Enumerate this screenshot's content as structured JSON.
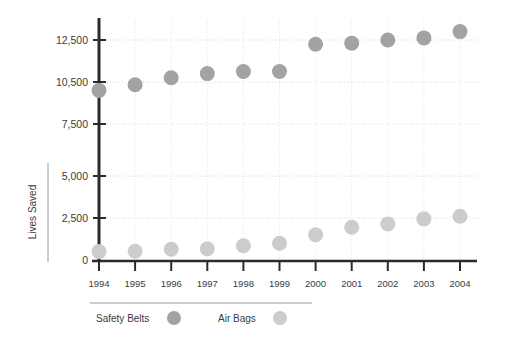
{
  "chart_data": {
    "type": "scatter",
    "title": "",
    "xlabel": "",
    "ylabel": "Lives Saved",
    "categories": [
      "1994",
      "1995",
      "1996",
      "1997",
      "1998",
      "1999",
      "2000",
      "2001",
      "2002",
      "2003",
      "2004"
    ],
    "ytick_labels": [
      "0",
      "2,500",
      "5,000",
      "7,500",
      "10,500",
      "12,500"
    ],
    "ytick_values": [
      0,
      2500,
      5000,
      7500,
      10500,
      12500
    ],
    "ylim": [
      0,
      13200
    ],
    "grid": true,
    "legend_position": "bottom",
    "series": [
      {
        "name": "Safety Belts",
        "color": "#a3a3a3",
        "values": [
          9900,
          10300,
          10700,
          10900,
          11000,
          11000,
          12300,
          12350,
          12500,
          12600,
          12900
        ]
      },
      {
        "name": "Air Bags",
        "color": "#cccccc",
        "values": [
          500,
          520,
          640,
          670,
          850,
          1000,
          1500,
          1950,
          2150,
          2450,
          2600
        ]
      }
    ]
  },
  "legend": {
    "items": [
      {
        "label": "Safety Belts",
        "color": "#a3a3a3"
      },
      {
        "label": "Air Bags",
        "color": "#cccccc"
      }
    ]
  },
  "axis": {
    "y_title": "Lives Saved"
  },
  "colors": {
    "axis": "#2b2b2b",
    "grid": "#d8d8d8",
    "text": "#3b3b3b",
    "rule": "#9a9a9a",
    "background": "#ffffff"
  }
}
